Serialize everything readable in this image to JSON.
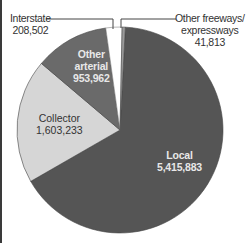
{
  "chart_data": {
    "type": "pie",
    "title": "",
    "unit": "miles",
    "slices": [
      {
        "label": "Local",
        "value": 5415883,
        "display": "5,415,883",
        "color": "#555555"
      },
      {
        "label": "Collector",
        "value": 1603233,
        "display": "1,603,233",
        "color": "#d6d6d6"
      },
      {
        "label": "Other arterial",
        "value": 953962,
        "display": "953,962",
        "color": "#6a6a6a"
      },
      {
        "label": "Interstate",
        "value": 208502,
        "display": "208,502",
        "color": "#ffffff"
      },
      {
        "label": "Other freeways/ expressways",
        "value": 41813,
        "display": "41,813",
        "color": "#9a9a9a"
      }
    ],
    "total": 8223393,
    "legend": "none (direct labels with leader lines)"
  },
  "labels": {
    "interstate": {
      "name": "Interstate",
      "value": "208,502"
    },
    "other_freeways": {
      "name_line1": "Other freeways/",
      "name_line2": "expressways",
      "value": "41,813"
    },
    "other_arterial": {
      "name_line1": "Other",
      "name_line2": "arterial",
      "value": "953,962"
    },
    "collector": {
      "name": "Collector",
      "value": "1,603,233"
    },
    "local": {
      "name": "Local",
      "value": "5,415,883"
    }
  }
}
